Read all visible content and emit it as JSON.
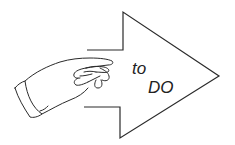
{
  "illustration": {
    "subject": "hand pointing into arrow",
    "text_line_1": "to",
    "text_line_2": "DO",
    "stroke_color": "#2a2a2a",
    "background_color": "#ffffff"
  }
}
